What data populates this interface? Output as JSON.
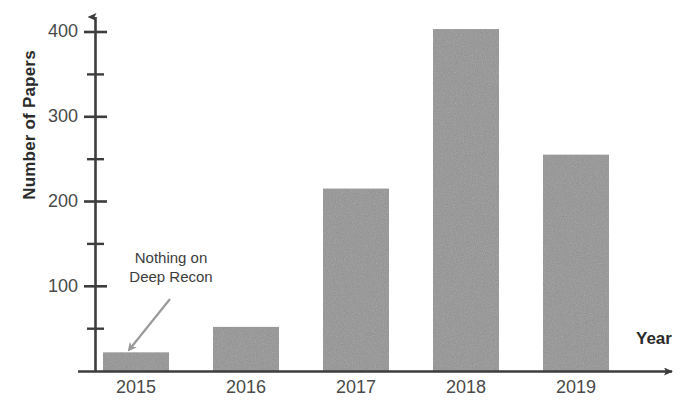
{
  "chart_data": {
    "type": "bar",
    "title": "",
    "xlabel": "Year",
    "ylabel": "Number of Papers",
    "categories": [
      "2015",
      "2016",
      "2017",
      "2018",
      "2019"
    ],
    "values": [
      22,
      52,
      215,
      403,
      255
    ],
    "series": [
      {
        "name": "Number of Papers",
        "values": [
          22,
          52,
          215,
          403,
          255
        ]
      }
    ],
    "ylim": [
      0,
      420
    ],
    "y_major_ticks": [
      100,
      200,
      300,
      400
    ],
    "y_minor_ticks": [
      50,
      150,
      250,
      350
    ],
    "y_tick_labels": [
      "100",
      "200",
      "300",
      "400"
    ],
    "grid": false,
    "legend": false,
    "legend_position": "none",
    "bar_color": "#939393",
    "axis_color": "#3d3d3d",
    "background_color": "#ffffff",
    "annotations": [
      {
        "text_line_1": "Nothing on",
        "text_line_2": "Deep Recon",
        "full_text": "Nothing on Deep Recon",
        "points_to_category": "2015",
        "arrow_color": "#9a9a9a"
      }
    ]
  },
  "axes": {
    "y_title": "Number of Papers",
    "x_title": "Year"
  },
  "y_ticks": [
    {
      "label": "400",
      "value": 400
    },
    {
      "label": "300",
      "value": 300
    },
    {
      "label": "200",
      "value": 200
    },
    {
      "label": "100",
      "value": 100
    }
  ],
  "x_ticks": [
    {
      "label": "2015"
    },
    {
      "label": "2016"
    },
    {
      "label": "2017"
    },
    {
      "label": "2018"
    },
    {
      "label": "2019"
    }
  ],
  "annotation": {
    "line1": "Nothing on",
    "line2": "Deep Recon"
  }
}
